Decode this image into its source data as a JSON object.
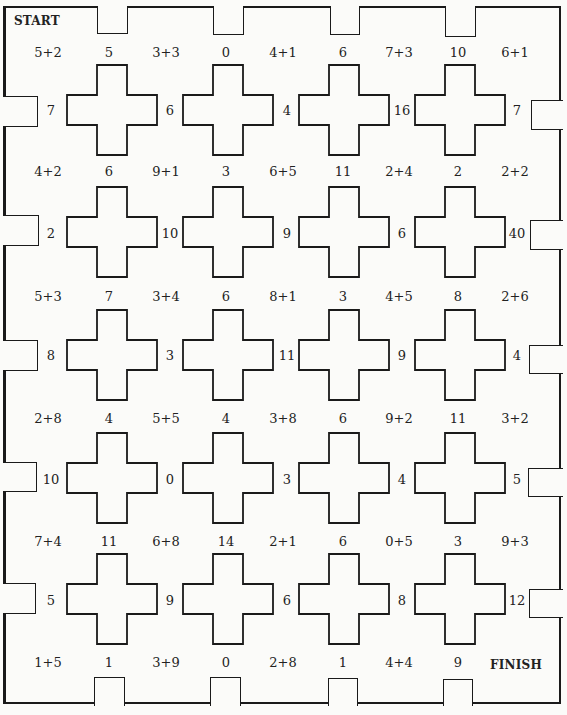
{
  "board": {
    "start_label": "START",
    "finish_label": "FINISH",
    "rows": [
      {
        "sums": [
          "5+2",
          "5",
          "3+3",
          "0",
          "4+1",
          "6",
          "7+3",
          "10",
          "6+1"
        ]
      },
      {
        "sides": [
          "7",
          "6",
          "4",
          "16",
          "7"
        ]
      },
      {
        "sums": [
          "4+2",
          "6",
          "9+1",
          "3",
          "6+5",
          "11",
          "2+4",
          "2",
          "2+2"
        ]
      },
      {
        "sides": [
          "2",
          "10",
          "9",
          "6",
          "40"
        ]
      },
      {
        "sums": [
          "5+3",
          "7",
          "3+4",
          "6",
          "8+1",
          "3",
          "4+5",
          "8",
          "2+6"
        ]
      },
      {
        "sides": [
          "8",
          "3",
          "11",
          "9",
          "4"
        ]
      },
      {
        "sums": [
          "2+8",
          "4",
          "5+5",
          "4",
          "3+8",
          "6",
          "9+2",
          "11",
          "3+2"
        ]
      },
      {
        "sides": [
          "10",
          "0",
          "3",
          "4",
          "5"
        ]
      },
      {
        "sums": [
          "7+4",
          "11",
          "6+8",
          "14",
          "2+1",
          "6",
          "0+5",
          "3",
          "9+3"
        ]
      },
      {
        "sides": [
          "5",
          "9",
          "6",
          "8",
          "12"
        ]
      },
      {
        "sums": [
          "1+5",
          "1",
          "3+9",
          "0",
          "2+8",
          "1",
          "4+4",
          "9"
        ]
      }
    ],
    "colors": {
      "line": "#1a1a1a",
      "paper": "#fbfbf9",
      "text": "#222222"
    }
  }
}
